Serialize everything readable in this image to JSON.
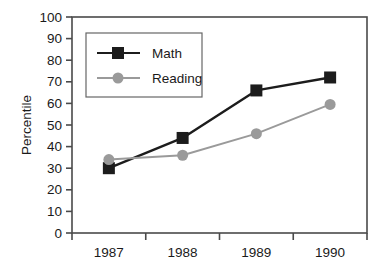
{
  "chart_data": {
    "type": "line",
    "title": "",
    "xlabel": "",
    "ylabel": "Percentile",
    "categories": [
      "1987",
      "1988",
      "1989",
      "1990"
    ],
    "ylim": [
      0,
      100
    ],
    "y_ticks": [
      "0",
      "10",
      "20",
      "30",
      "40",
      "50",
      "60",
      "70",
      "80",
      "90",
      "100"
    ],
    "grid": false,
    "legend_position": "top-left-inside",
    "series": [
      {
        "name": "Math",
        "values": [
          30,
          44,
          66,
          72
        ],
        "color": "#1c1c1c",
        "marker": "square"
      },
      {
        "name": "Reading",
        "values": [
          34,
          36,
          46,
          59.5
        ],
        "color": "#9a9a9a",
        "marker": "circle"
      }
    ]
  },
  "legend": {
    "items": [
      {
        "label": "Math"
      },
      {
        "label": "Reading"
      }
    ]
  },
  "colors": {
    "math": "#1c1c1c",
    "reading": "#9a9a9a",
    "axis": "#4a4a4a",
    "text": "#1a1a1a",
    "background": "#ffffff"
  }
}
